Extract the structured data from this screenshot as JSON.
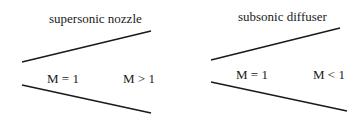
{
  "panels": [
    {
      "title": "supersonic nozzle",
      "inlet_label": "M = 1",
      "outlet_label": "M > 1"
    },
    {
      "title": "subsonic diffuser",
      "inlet_label": "M = 1",
      "outlet_label": "M < 1"
    }
  ]
}
